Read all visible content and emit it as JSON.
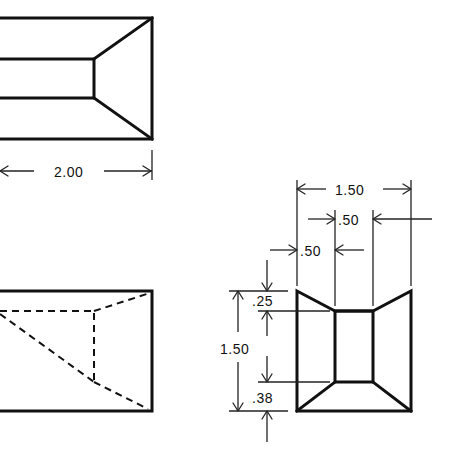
{
  "drawing": {
    "type": "orthographic-projection",
    "line_color": "#111111",
    "background": "#ffffff"
  },
  "views": {
    "top_view": {
      "label": "top view (partial, cropped left)",
      "dimensions": {
        "width": "2.00"
      }
    },
    "side_view": {
      "label": "side view with hidden lines (partial, cropped left)"
    },
    "front_view": {
      "label": "front view (trapezoidal cavity)",
      "dimensions": {
        "overall_width": "1.50",
        "inner_width": ".50",
        "left_offset": ".50",
        "overall_height": "1.50",
        "top_offset": ".25",
        "bottom_offset": ".38"
      }
    }
  }
}
